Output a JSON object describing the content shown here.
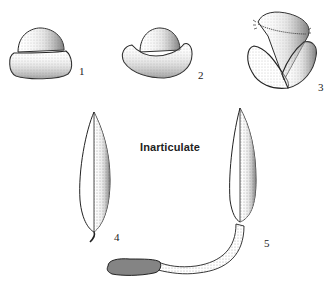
{
  "title": "Inarticulate",
  "figures": [
    {
      "id": 1,
      "label": "1",
      "description": "pebble-shaped spadix, two-layered dome"
    },
    {
      "id": 2,
      "label": "2",
      "description": "cup-shaped spathe with dome"
    },
    {
      "id": 3,
      "label": "3",
      "description": "flower with fringed top and two lateral lobes"
    },
    {
      "id": 4,
      "label": "4",
      "description": "narrow lanceolate spathe with short curled stalk"
    },
    {
      "id": 5,
      "label": "5",
      "description": "tall spathe with long curved peduncle and dense spike"
    }
  ],
  "colors": {
    "ink": "#222222",
    "shade": "#7a7a7a",
    "background": "#ffffff"
  }
}
